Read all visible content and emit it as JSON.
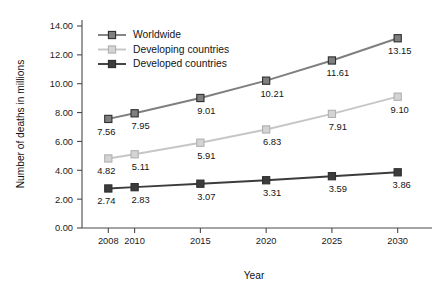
{
  "chart_data": {
    "type": "line",
    "title": "",
    "xlabel": "Year",
    "ylabel": "Number of deaths in millions",
    "x": [
      2008,
      2010,
      2015,
      2020,
      2025,
      2030
    ],
    "xtick_labels": [
      "2008",
      "2010",
      "2015",
      "2020",
      "2025",
      "2030"
    ],
    "xlim": [
      2006,
      2032
    ],
    "ylim": [
      0,
      14
    ],
    "ytick_labels": [
      "0.00",
      "2.00",
      "4.00",
      "6.00",
      "8.00",
      "10.00",
      "12.00",
      "14.00"
    ],
    "ytick_values": [
      0,
      2,
      4,
      6,
      8,
      10,
      12,
      14
    ],
    "grid": false,
    "legend_position": "upper-left-inside",
    "series": [
      {
        "name": "Worldwide",
        "color": "#7f7f7f",
        "marker": "square-filled",
        "values": [
          7.56,
          7.95,
          9.01,
          10.21,
          11.61,
          13.15
        ],
        "labels": [
          "7.56",
          "7.95",
          "9.01",
          "10.21",
          "11.61",
          "13.15"
        ]
      },
      {
        "name": "Developing countries",
        "color": "#c6c6c6",
        "marker": "square-open",
        "values": [
          4.82,
          5.11,
          5.91,
          6.83,
          7.91,
          9.1
        ],
        "labels": [
          "4.82",
          "5.11",
          "5.91",
          "6.83",
          "7.91",
          "9.10"
        ]
      },
      {
        "name": "Developed countries",
        "color": "#3c3c3c",
        "marker": "square-filled",
        "values": [
          2.74,
          2.83,
          3.07,
          3.31,
          3.59,
          3.86
        ],
        "labels": [
          "2.74",
          "2.83",
          "3.07",
          "3.31",
          "3.59",
          "3.86"
        ]
      }
    ]
  },
  "legend": {
    "items": [
      {
        "label": "Worldwide"
      },
      {
        "label": "Developing countries"
      },
      {
        "label": "Developed countries"
      }
    ]
  },
  "axes": {
    "x_title": "Year",
    "y_title": "Number of deaths in millions"
  }
}
